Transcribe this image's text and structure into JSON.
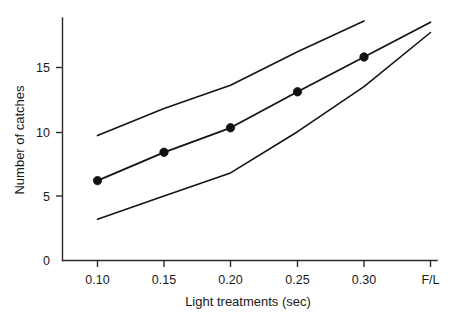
{
  "chart_data": {
    "type": "line",
    "title": "",
    "xlabel": "Light treatments (sec)",
    "ylabel": "Number of catches",
    "categories": [
      "0.10",
      "0.15",
      "0.20",
      "0.25",
      "0.30",
      "F/L"
    ],
    "x_tick_labels": [
      "0.10",
      "0.15",
      "0.20",
      "0.25",
      "0.30",
      "F/L"
    ],
    "y_tick_labels": [
      "0",
      "5",
      "10",
      "15"
    ],
    "y_ticks": [
      0,
      5,
      10,
      15
    ],
    "ylim": [
      0,
      18.8
    ],
    "grid": false,
    "legend": null,
    "series": [
      {
        "name": "upper-confidence-limit",
        "markers": false,
        "x": [
          "0.10",
          "0.15",
          "0.20",
          "0.25",
          "0.30"
        ],
        "values": [
          9.7,
          11.8,
          13.6,
          16.2,
          18.6
        ]
      },
      {
        "name": "mean-number-of-catches",
        "markers": true,
        "x": [
          "0.10",
          "0.15",
          "0.20",
          "0.25",
          "0.30",
          "F/L"
        ],
        "values": [
          6.2,
          8.4,
          10.3,
          13.1,
          15.8,
          18.5
        ]
      },
      {
        "name": "lower-confidence-limit",
        "markers": false,
        "x": [
          "0.10",
          "0.15",
          "0.20",
          "0.25",
          "0.30",
          "F/L"
        ],
        "values": [
          3.2,
          5.0,
          6.8,
          10.0,
          13.5,
          17.7
        ]
      }
    ],
    "data_points": [
      {
        "x": "0.10",
        "y": 6.2
      },
      {
        "x": "0.15",
        "y": 8.4
      },
      {
        "x": "0.20",
        "y": 10.3
      },
      {
        "x": "0.25",
        "y": 13.1
      },
      {
        "x": "0.30",
        "y": 15.8
      }
    ]
  },
  "axes": {
    "y_title": "Number of catches",
    "x_title": "Light treatments (sec)",
    "y_labels": {
      "t0": "0",
      "t5": "5",
      "t10": "10",
      "t15": "15"
    },
    "x_labels": {
      "t1": "0.10",
      "t2": "0.15",
      "t3": "0.20",
      "t4": "0.25",
      "t5": "0.30",
      "t6": "F/L"
    }
  },
  "colors": {
    "line": "#141414",
    "axis": "#2b2b2b",
    "marker": "#111111",
    "background": "#ffffff"
  }
}
